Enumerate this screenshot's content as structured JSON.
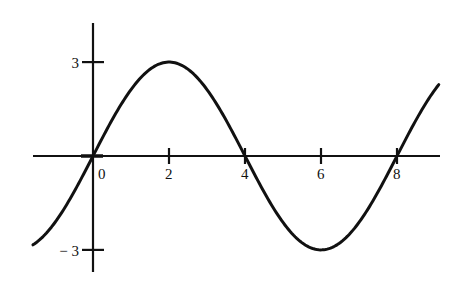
{
  "chart_data": {
    "type": "line",
    "title": "",
    "xlabel": "",
    "ylabel": "",
    "function": "y = 3 sin(pi x / 4)",
    "amplitude": 3,
    "period": 8,
    "xlim": [
      -1.58,
      9.1
    ],
    "ylim": [
      -3.7,
      4.2
    ],
    "grid": false,
    "legend": null,
    "x_ticks": [
      0,
      2,
      4,
      6,
      8
    ],
    "x_tick_labels": [
      "0",
      "2",
      "4",
      "6",
      "8"
    ],
    "y_ticks": [
      3,
      -3
    ],
    "y_tick_labels": [
      "3",
      "− 3"
    ],
    "series": [
      {
        "name": "curve",
        "x": [
          -1.5,
          -1,
          0,
          1,
          2,
          3,
          4,
          5,
          6,
          7,
          8,
          9
        ],
        "values": [
          -2.77,
          -2.12,
          0,
          2.12,
          3,
          2.12,
          0,
          -2.12,
          -3,
          -2.12,
          0,
          2.12
        ]
      }
    ],
    "color": "#111111"
  }
}
